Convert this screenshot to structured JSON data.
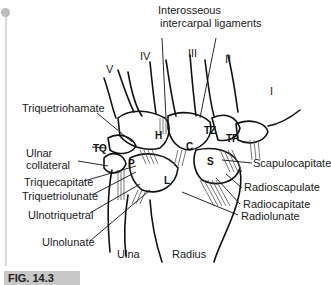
{
  "figure": {
    "caption": "FIG. 14.3",
    "top_label": [
      "Interosseous",
      "intercarpal ligaments"
    ],
    "metacarpals": [
      "V",
      "IV",
      "III",
      "II",
      "I"
    ],
    "bones": {
      "hamate": "H",
      "capitate": "C",
      "trapezoid": "TZ",
      "trapezium": "TP",
      "triquetrum": "TQ",
      "pisiform": "P",
      "scaphoid": "S",
      "lunate": "L"
    },
    "left_labels": [
      "Triquetriohamate",
      "Ulnar",
      "collateral",
      "Triquecapitate",
      "Triquetriolunate",
      "Ulnotriquetral",
      "Ulnolunate"
    ],
    "right_labels": [
      "Scapulocapitate",
      "Radioscapulate",
      "Radiocapitate",
      "Radiolunate"
    ],
    "bottom_labels": [
      "Ulna",
      "Radius"
    ]
  }
}
